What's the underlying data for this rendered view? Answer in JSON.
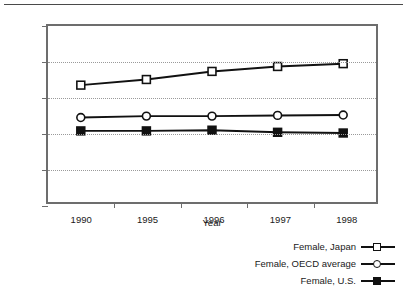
{
  "chart_data": {
    "type": "line",
    "title": "",
    "subtitle": "",
    "xlabel": "Year",
    "ylabel": "Share in All Employees (%)",
    "categories": [
      "1990",
      "1995",
      "1996",
      "1997",
      "1998"
    ],
    "x": [
      1990,
      1995,
      1996,
      1997,
      1998
    ],
    "ylim": [
      0,
      50
    ],
    "yticks": [
      0,
      10,
      20,
      30,
      40,
      50
    ],
    "ytick_labels": [
      "0",
      "10",
      "20",
      "30",
      "40",
      "50"
    ],
    "grid": "horizontal-dotted",
    "legend_position": "below-right",
    "series": [
      {
        "name": "Female, Japan",
        "marker": "open-square",
        "color": "#111111",
        "values": [
          33.2,
          34.8,
          37.1,
          38.5,
          39.3
        ]
      },
      {
        "name": "Female, OECD average",
        "marker": "open-circle",
        "color": "#111111",
        "values": [
          24.0,
          24.4,
          24.4,
          24.6,
          24.7
        ]
      },
      {
        "name": "Female, U.S.",
        "marker": "filled-square",
        "color": "#111111",
        "values": [
          20.2,
          20.2,
          20.4,
          19.8,
          19.6
        ]
      }
    ]
  },
  "axes": {
    "y_label": "Share in All Employees (%)",
    "x_label": "Year",
    "y_ticks": [
      "50",
      "40",
      "30",
      "20",
      "10",
      "0"
    ],
    "x_ticks": [
      "1990",
      "1995",
      "1996",
      "1997",
      "1998"
    ]
  },
  "legend": {
    "items": [
      {
        "label": "Female, Japan",
        "marker": "open-square"
      },
      {
        "label": "Female, OECD average",
        "marker": "open-circle"
      },
      {
        "label": "Female, U.S.",
        "marker": "filled-square"
      }
    ]
  },
  "style": {
    "frame_color": "#6d6d6d",
    "grid_color": "#9a9a9a",
    "line_color": "#111111",
    "background": "#ffffff"
  }
}
